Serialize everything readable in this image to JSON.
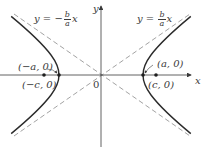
{
  "figure": {
    "colors": {
      "curve": "#2b2b2b",
      "axis": "#3a3a3a",
      "asymptote": "#8a8a8a",
      "text": "#3a3a3a"
    },
    "axes": {
      "x_label": "x",
      "y_label": "y",
      "origin_label": "0"
    },
    "asymptotes": [
      {
        "id": "positive",
        "prefix": "y = ",
        "sign": "",
        "num": "b",
        "den": "a",
        "suffix": "x"
      },
      {
        "id": "negative",
        "prefix": "y = ",
        "sign": "−",
        "num": "b",
        "den": "a",
        "suffix": "x"
      }
    ],
    "points": [
      {
        "id": "left-vertex",
        "label": "(−a, 0)"
      },
      {
        "id": "left-focus",
        "label": "(−c, 0)"
      },
      {
        "id": "right-vertex",
        "label": "(a, 0)"
      },
      {
        "id": "right-focus",
        "label": "(c, 0)"
      }
    ]
  }
}
